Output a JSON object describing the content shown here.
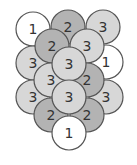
{
  "diagram": {
    "title": "",
    "colors": {
      "1": "#ffffff",
      "2": "#b3b3b3",
      "3": "#d7d7d7",
      "stroke": "#555555",
      "text": "#333333"
    },
    "radius": 17,
    "circles": [
      {
        "label": "1",
        "cx": 33,
        "cy": 29
      },
      {
        "label": "2",
        "cx": 68,
        "cy": 27
      },
      {
        "label": "3",
        "cx": 103,
        "cy": 27
      },
      {
        "label": "3",
        "cx": 33,
        "cy": 63
      },
      {
        "label": "1",
        "cx": 106,
        "cy": 62
      },
      {
        "label": "2",
        "cx": 52,
        "cy": 46
      },
      {
        "label": "3",
        "cx": 87,
        "cy": 46
      },
      {
        "label": "3",
        "cx": 33,
        "cy": 97
      },
      {
        "label": "3",
        "cx": 106,
        "cy": 97
      },
      {
        "label": "3",
        "cx": 51,
        "cy": 80
      },
      {
        "label": "2",
        "cx": 87,
        "cy": 80
      },
      {
        "label": "3",
        "cx": 69,
        "cy": 64
      },
      {
        "label": "2",
        "cx": 51,
        "cy": 115
      },
      {
        "label": "2",
        "cx": 87,
        "cy": 115
      },
      {
        "label": "3",
        "cx": 69,
        "cy": 97
      },
      {
        "label": "1",
        "cx": 69,
        "cy": 133
      }
    ]
  }
}
